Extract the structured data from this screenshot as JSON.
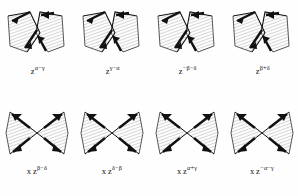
{
  "figure": {
    "kind": "mathematical-diagram-plate",
    "background_color": "#fefefe",
    "ink_color": "#111111",
    "shade_color": "#d9d9d9",
    "rows": [
      {
        "name": "top-row",
        "shape_style": "wedge-pair",
        "cells": [
          {
            "id": "cell-1",
            "prefix": "",
            "base": "z",
            "exponent": "α−γ",
            "full_label": "z^(α−γ)"
          },
          {
            "id": "cell-2",
            "prefix": "",
            "base": "z",
            "exponent": "γ−α",
            "full_label": "z^(γ−α)"
          },
          {
            "id": "cell-3",
            "prefix": "",
            "base": "z",
            "exponent": "−β−δ",
            "full_label": "z^(−β−δ)"
          },
          {
            "id": "cell-4",
            "prefix": "",
            "base": "z",
            "exponent": "β+δ",
            "full_label": "z^(β+δ)"
          }
        ]
      },
      {
        "name": "bottom-row",
        "shape_style": "butterfly-crossed",
        "cells": [
          {
            "id": "cell-5",
            "prefix": "x",
            "base": "z",
            "exponent": "β−δ",
            "full_label": "x z^(β−δ)"
          },
          {
            "id": "cell-6",
            "prefix": "x",
            "base": "z",
            "exponent": "δ−β",
            "full_label": "x z^(δ−β)"
          },
          {
            "id": "cell-7",
            "prefix": "x",
            "base": "z",
            "exponent": "α+γ",
            "full_label": "x z^(α+γ)"
          },
          {
            "id": "cell-8",
            "prefix": "x",
            "base": "z",
            "exponent": "−α−γ",
            "full_label": "x z^(−α−γ)"
          }
        ]
      }
    ]
  }
}
